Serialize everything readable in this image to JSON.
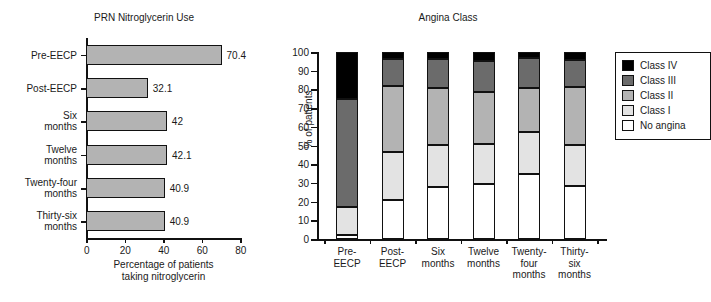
{
  "figure": {
    "left_panel": {
      "title": "PRN Nitroglycerin Use",
      "xlabel_line1": "Percentage of patients",
      "xlabel_line2": "taking nitroglycerin"
    },
    "right_panel": {
      "title": "Angina Class",
      "ylabel": "% of patients"
    }
  },
  "chart_data": [
    {
      "type": "bar",
      "orientation": "horizontal",
      "title": "PRN Nitroglycerin Use",
      "xlabel": "Percentage of patients taking nitroglycerin",
      "ylabel": "",
      "xlim": [
        0,
        80
      ],
      "xticks": [
        0,
        20,
        40,
        60,
        80
      ],
      "grid": false,
      "categories": [
        "Pre-EECP",
        "Post-EECP",
        "Six months",
        "Twelve months",
        "Twenty-four months",
        "Thirty-six months"
      ],
      "category_lines": [
        [
          "Pre-EECP"
        ],
        [
          "Post-EECP"
        ],
        [
          "Six",
          "months"
        ],
        [
          "Twelve",
          "months"
        ],
        [
          "Twenty-four",
          "months"
        ],
        [
          "Thirty-six",
          "months"
        ]
      ],
      "values": [
        70.4,
        32.1,
        42,
        42.1,
        40.9,
        40.9
      ],
      "value_labels": [
        "70.4",
        "32.1",
        "42",
        "42.1",
        "40.9",
        "40.9"
      ],
      "bar_color": "#b3b3b3"
    },
    {
      "type": "bar",
      "subtype": "stacked-100",
      "orientation": "vertical",
      "title": "Angina Class",
      "xlabel": "",
      "ylabel": "% of patients",
      "ylim": [
        0,
        100
      ],
      "yticks": [
        0,
        10,
        20,
        30,
        40,
        50,
        60,
        70,
        80,
        90,
        100
      ],
      "grid": false,
      "legend_position": "right",
      "categories": [
        "Pre-EECP",
        "Post-EECP",
        "Six months",
        "Twelve months",
        "Twenty-four months",
        "Thirty-six months"
      ],
      "category_lines": [
        [
          "Pre-",
          "EECP"
        ],
        [
          "Post-",
          "EECP"
        ],
        [
          "Six",
          "months"
        ],
        [
          "Twelve",
          "months"
        ],
        [
          "Twenty-",
          "four",
          "months"
        ],
        [
          "Thirty-",
          "six",
          "months"
        ]
      ],
      "series": [
        {
          "name": "No angina",
          "color": "#ffffff",
          "values": [
            2.3,
            21.0,
            28.0,
            29.5,
            34.5,
            28.5
          ]
        },
        {
          "name": "Class I",
          "color": "#e3e3e3",
          "values": [
            14.7,
            25.5,
            22.5,
            21.5,
            22.5,
            22.0
          ]
        },
        {
          "name": "Class II",
          "color": "#b3b3b3",
          "values": [
            0.0,
            35.5,
            30.5,
            27.5,
            24.0,
            31.0
          ]
        },
        {
          "name": "Class III",
          "color": "#6b6b6b",
          "values": [
            58.0,
            14.5,
            15.5,
            16.5,
            16.0,
            14.0
          ]
        },
        {
          "name": "Class IV",
          "color": "#000000",
          "values": [
            25.0,
            3.5,
            3.5,
            5.0,
            3.0,
            4.5
          ]
        }
      ],
      "stack_tops": {
        "Pre-EECP": {
          "no_angina": 2.3,
          "class_i": 17.0,
          "class_ii": 17.0,
          "class_iii": 75.0,
          "class_iv": 100
        },
        "Post-EECP": {
          "no_angina": 21.0,
          "class_i": 46.5,
          "class_ii": 82.0,
          "class_iii": 96.5,
          "class_iv": 100
        },
        "Six months": {
          "no_angina": 28.0,
          "class_i": 50.5,
          "class_ii": 81.0,
          "class_iii": 96.5,
          "class_iv": 100
        },
        "Twelve months": {
          "no_angina": 29.5,
          "class_i": 51.0,
          "class_ii": 78.5,
          "class_iii": 95.0,
          "class_iv": 100
        },
        "Twenty-four months": {
          "no_angina": 34.5,
          "class_i": 57.0,
          "class_ii": 81.0,
          "class_iii": 97.0,
          "class_iv": 100
        },
        "Thirty-six months": {
          "no_angina": 28.5,
          "class_i": 50.5,
          "class_ii": 81.5,
          "class_iii": 95.5,
          "class_iv": 100
        }
      },
      "legend": [
        {
          "label": "Class IV",
          "color": "#000000"
        },
        {
          "label": "Class III",
          "color": "#6b6b6b"
        },
        {
          "label": "Class II",
          "color": "#b3b3b3"
        },
        {
          "label": "Class I",
          "color": "#e3e3e3"
        },
        {
          "label": "No angina",
          "color": "#ffffff"
        }
      ]
    }
  ]
}
